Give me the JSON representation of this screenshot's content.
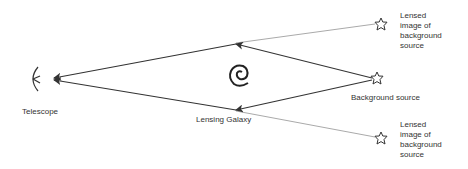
{
  "diagram": {
    "labels": {
      "telescope": "Telescope",
      "lensing_galaxy": "Lensing Galaxy",
      "background_source": "Background source",
      "lensed_image_top": "Lensed\nimage of\nbackground\nsource",
      "lensed_image_bottom": "Lensed\nimage of\nbackground\nsource"
    },
    "nodes": [
      {
        "id": "telescope",
        "x": 38,
        "y": 78
      },
      {
        "id": "lensing_galaxy",
        "x": 238,
        "y": 75
      },
      {
        "id": "background_source",
        "x": 376,
        "y": 77
      },
      {
        "id": "lensed_image_top",
        "x": 380,
        "y": 24
      },
      {
        "id": "lensed_image_bottom",
        "x": 380,
        "y": 138
      }
    ],
    "colors": {
      "ray": "#333333",
      "apparent_ray": "#aaaaaa",
      "text": "#333333"
    }
  }
}
